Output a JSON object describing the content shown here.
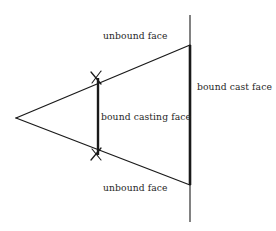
{
  "diagram": {
    "canvas": {
      "width": 276,
      "height": 231,
      "background": "#ffffff"
    },
    "stroke_color": "#1a1a1a",
    "text_color": "#262626",
    "labels": {
      "unbound_top": "unbound face",
      "unbound_bottom": "unbound face",
      "bound_casting": "bound casting face",
      "bound_cast": "bound cast face"
    },
    "shapes": {
      "apex": {
        "x": 16,
        "y": 118
      },
      "top_vertex": {
        "x": 190,
        "y": 45
      },
      "bottom_vertex": {
        "x": 190,
        "y": 185
      },
      "vertical_line": {
        "x": 190,
        "y_top": 15,
        "y_bottom": 222,
        "thin_width": 1,
        "thick_width": 2.6
      },
      "bound_casting_segment": {
        "x": 98,
        "y_top": 78,
        "y_bottom": 155,
        "width": 2.4
      },
      "tick_upper": {
        "x": 98,
        "y": 78
      },
      "tick_lower": {
        "x": 98,
        "y": 153
      }
    }
  }
}
